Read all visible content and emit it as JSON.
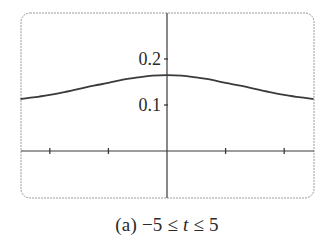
{
  "chart_data": {
    "type": "line",
    "title": "",
    "caption": "(a) −5 ≤ t ≤ 5",
    "caption_parts": {
      "prefix": "(a) −5 ≤ ",
      "var": "t",
      "suffix": " ≤ 5"
    },
    "xlabel": "",
    "ylabel": "",
    "xlim": [
      -5,
      5
    ],
    "ylim": [
      -0.11,
      0.29
    ],
    "x_ticks": [
      -4,
      -2,
      2,
      4
    ],
    "x_tick_labels": [],
    "y_ticks": [
      0.1,
      0.2
    ],
    "y_tick_labels": [
      "0.1",
      "0.2"
    ],
    "grid": false,
    "legend": null,
    "series": [
      {
        "name": "f(t)",
        "x": [
          -5,
          -4.5,
          -4,
          -3.5,
          -3,
          -2.5,
          -2,
          -1.5,
          -1,
          -0.5,
          0,
          0.5,
          1,
          1.5,
          2,
          2.5,
          3,
          3.5,
          4,
          4.5,
          5
        ],
        "y": [
          0.113,
          0.117,
          0.122,
          0.128,
          0.135,
          0.142,
          0.148,
          0.155,
          0.16,
          0.164,
          0.165,
          0.164,
          0.16,
          0.155,
          0.148,
          0.142,
          0.135,
          0.128,
          0.122,
          0.117,
          0.113
        ]
      }
    ]
  },
  "colors": {
    "curve": "#3a3a3a",
    "axis": "#3a3a3a",
    "frame": "#9a9a9a",
    "text": "#2a2a2a"
  }
}
